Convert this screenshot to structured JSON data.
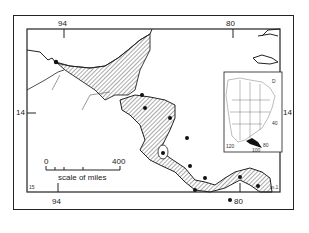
{
  "map": {
    "longitude_labels_top": [
      "94",
      "80"
    ],
    "longitude_labels_bottom": [
      "94",
      "80"
    ],
    "latitude_labels_left": [
      "14"
    ],
    "latitude_labels_right": [
      "14"
    ],
    "corner_labels": {
      "bottom_left": "15",
      "bottom_right": "m.1"
    },
    "scale": {
      "start": "0",
      "end": "400",
      "caption": "scale of miles"
    },
    "inset": {
      "labels": [
        "D",
        "40",
        "120",
        "100",
        "80"
      ]
    },
    "colors": {
      "ink": "#222222",
      "hatch": "#555555",
      "background": "#ffffff"
    }
  }
}
